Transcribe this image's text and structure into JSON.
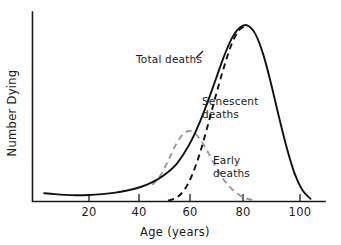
{
  "chart_data": {
    "type": "line",
    "title": "",
    "xlabel": "Age (years)",
    "ylabel": "Number Dying",
    "xlim": [
      0,
      108
    ],
    "ylim": [
      0,
      100
    ],
    "grid": false,
    "legend_position": "inline-annotations",
    "xticks": [
      20,
      40,
      60,
      80,
      100
    ],
    "xtick_labels": [
      "20",
      "40",
      "60",
      "80",
      "100"
    ],
    "yticks": [],
    "ytick_labels": [],
    "annotations": [
      {
        "text": "Total deaths",
        "series": "total-deaths",
        "x": 42,
        "y": 68
      },
      {
        "text_line1": "Senescent",
        "text_line2": "deaths",
        "series": "senescent-deaths",
        "x": 67,
        "y": 46
      },
      {
        "text_line1": "Early",
        "text_line2": "deaths",
        "series": "early-deaths",
        "x": 75,
        "y": 22
      }
    ],
    "series": [
      {
        "name": "Total deaths",
        "style": "solid",
        "color": "#111111",
        "x": [
          3,
          7,
          11,
          15,
          20,
          25,
          30,
          34,
          38,
          42,
          46,
          50,
          53,
          56,
          59,
          62,
          65,
          68,
          71,
          74,
          77,
          80,
          83,
          86,
          89,
          92,
          95,
          98,
          101,
          104
        ],
        "values": [
          4.5,
          4.0,
          3.6,
          3.4,
          3.5,
          4.0,
          4.8,
          5.8,
          7.2,
          9.2,
          12.0,
          16.0,
          20.0,
          26.0,
          33.5,
          43.0,
          54.0,
          66.0,
          78.0,
          88.0,
          94.0,
          95.5,
          91.0,
          80.0,
          64.0,
          46.0,
          29.0,
          15.0,
          6.0,
          1.5
        ]
      },
      {
        "name": "Senescent deaths",
        "style": "dashed",
        "color": "#111111",
        "x": [
          50,
          53,
          56,
          59,
          62,
          65,
          68,
          71,
          74,
          77,
          80
        ],
        "values": [
          0.5,
          2.0,
          6.0,
          14.0,
          26.0,
          41.0,
          57.0,
          72.0,
          85.0,
          93.0,
          95.5
        ]
      },
      {
        "name": "Early deaths",
        "style": "dashed",
        "color": "#9a9a9a",
        "x": [
          44,
          47,
          50,
          53,
          56,
          59,
          62,
          65,
          68,
          71,
          74,
          77,
          80,
          83
        ],
        "values": [
          9.0,
          14.0,
          22.0,
          31.0,
          37.0,
          38.0,
          34.0,
          27.0,
          19.0,
          12.0,
          7.0,
          3.5,
          1.5,
          0.5
        ]
      }
    ]
  },
  "labels": {
    "y_axis_title": "Number Dying",
    "x_axis_title": "Age (years)",
    "tick_20": "20",
    "tick_40": "40",
    "tick_60": "60",
    "tick_80": "80",
    "tick_100": "100",
    "total_deaths": "Total deaths",
    "senescent_line1": "Senescent",
    "senescent_line2": "deaths",
    "early_line1": "Early",
    "early_line2": "deaths"
  },
  "colors": {
    "axis": "#1a1a1a",
    "total_curve": "#111111",
    "senescent_curve": "#111111",
    "early_curve": "#9a9a9a",
    "background": "#ffffff"
  }
}
